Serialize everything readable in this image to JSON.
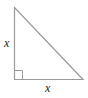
{
  "diagram": {
    "type": "right-triangle",
    "labels": {
      "left_leg": "x",
      "bottom_leg": "x"
    },
    "right_angle_marker": true,
    "stroke_color": "#9a9a9a"
  }
}
